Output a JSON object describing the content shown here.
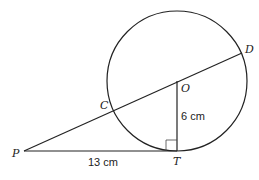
{
  "diagram": {
    "type": "circle-tangent-geometry",
    "points": {
      "P": {
        "label": "P",
        "x": 24,
        "y": 151
      },
      "C": {
        "label": "C",
        "x": 113,
        "y": 110
      },
      "O": {
        "label": "O",
        "x": 177,
        "y": 81
      },
      "D": {
        "label": "D",
        "x": 242,
        "y": 53
      },
      "T": {
        "label": "T",
        "x": 177,
        "y": 151
      }
    },
    "circle": {
      "center": "O",
      "radius_px": 70
    },
    "segments": [
      {
        "from": "P",
        "to": "D",
        "via": [
          "C",
          "O"
        ]
      },
      {
        "from": "P",
        "to": "T"
      },
      {
        "from": "O",
        "to": "T"
      }
    ],
    "measurements": {
      "PT": "13 cm",
      "OT": "6 cm"
    },
    "right_angle_at": "T"
  }
}
